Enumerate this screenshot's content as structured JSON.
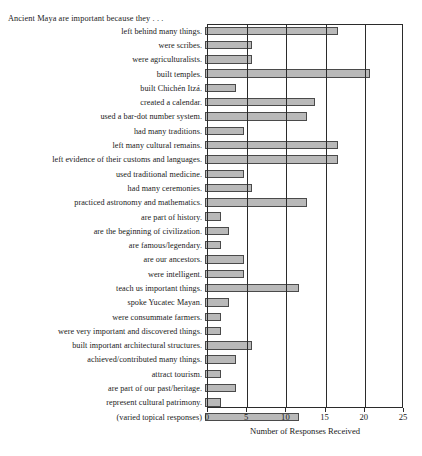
{
  "chart_data": {
    "type": "bar",
    "orientation": "horizontal",
    "title": "Ancient Maya are important because they . . .",
    "xlabel": "Number of Responses Received",
    "ylabel": "",
    "xlim": [
      0,
      25
    ],
    "xticks": [
      0,
      5,
      10,
      15,
      20,
      25
    ],
    "xtick_labels": [
      "0",
      "5",
      "10",
      "15",
      "20",
      "25"
    ],
    "grid": "vertical",
    "legend": "none",
    "bar_color": "#b9b9b9",
    "bar_edge_color": "#4a4a4a",
    "categories": [
      "left behind many things.",
      "were scribes.",
      "were agriculturalists.",
      "built temples.",
      "built Chichén Itzá.",
      "created a calendar.",
      "used a bar-dot number system.",
      "had many traditions.",
      "left many cultural remains.",
      "left evidence of their customs and languages.",
      "used traditional medicine.",
      "had many ceremonies.",
      "practiced astronomy and mathematics.",
      "are part of history.",
      "are the beginning of civilization.",
      "are famous/legendary.",
      "are our ancestors.",
      "were intelligent.",
      "teach us important things.",
      "spoke Yucatec Mayan.",
      "were consummate farmers.",
      "were very important and discovered things.",
      "built important architectural structures.",
      "achieved/contributed many things.",
      "attract tourism.",
      "are part of our past/heritage.",
      "represent cultural patrimony.",
      "(varied topical responses)"
    ],
    "values": [
      17,
      6,
      6,
      21,
      4,
      14,
      13,
      5,
      17,
      17,
      5,
      6,
      13,
      2,
      3,
      2,
      5,
      5,
      12,
      3,
      2,
      2,
      6,
      4,
      2,
      4,
      2,
      12
    ]
  }
}
